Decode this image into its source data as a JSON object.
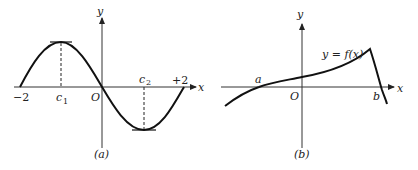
{
  "panel_a": {
    "caption": "(a)",
    "x_axis_label": "x",
    "y_axis_label": "y",
    "origin_label": "O",
    "tick_left": "−2",
    "tick_right": "+2",
    "c1_main": "c",
    "c1_sub": "1",
    "c2_main": "c",
    "c2_sub": "2",
    "description": "Sine-like curve on [-2, 2] with a maximum at c1 and minimum at c2, horizontal tangents at extrema"
  },
  "panel_b": {
    "caption": "(b)",
    "x_axis_label": "x",
    "y_axis_label": "y",
    "origin_label": "O",
    "root_a": "a",
    "root_b": "b",
    "curve_label": "y = f(x)",
    "description": "Increasing curve crossing x-axis at a, rising to a sharp corner peak, then dropping to cross at b"
  }
}
